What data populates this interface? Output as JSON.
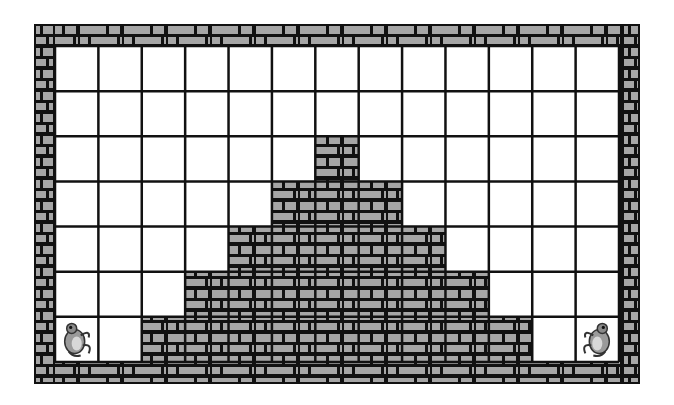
{
  "game": {
    "title": "Frog wall puzzle",
    "grid": {
      "columns": 13,
      "rows": 7
    },
    "wall_heights": [
      0,
      0,
      1,
      2,
      3,
      4,
      5,
      4,
      3,
      2,
      1,
      0,
      0
    ],
    "frogs": [
      {
        "id": "frog-left",
        "column": 0,
        "row_from_bottom": 0,
        "facing": "right"
      },
      {
        "id": "frog-right",
        "column": 12,
        "row_from_bottom": 0,
        "facing": "left"
      }
    ],
    "colors": {
      "brick": "#a6a6a6",
      "mortar": "#111111",
      "cell": "#ffffff",
      "grid_line": "#111111"
    }
  }
}
